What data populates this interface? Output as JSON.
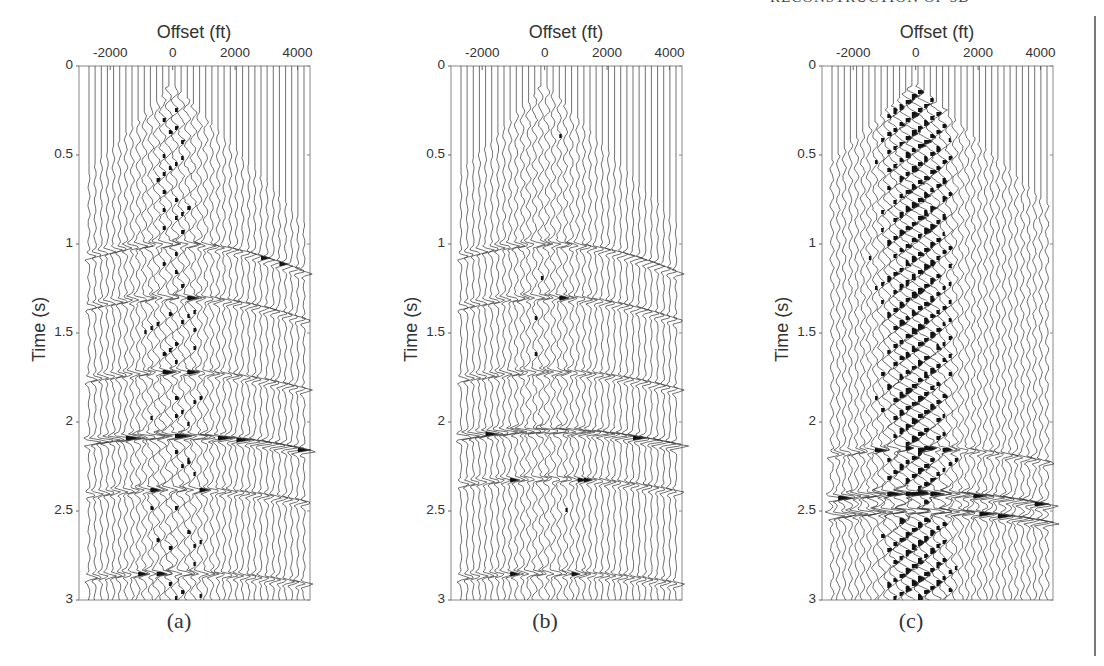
{
  "page": {
    "header_fragment": "RECONSTRUCTION OF 3D",
    "figure_panels": [
      {
        "id": "a",
        "caption": "(a)",
        "x_title": "Offset (ft)",
        "y_title": "Time (s)"
      },
      {
        "id": "b",
        "caption": "(b)",
        "x_title": "Offset (ft)",
        "y_title": "Time (s)"
      },
      {
        "id": "c",
        "caption": "(c)",
        "x_title": "Offset (ft)",
        "y_title": "Time (s)"
      }
    ]
  },
  "chart_data": [
    {
      "type": "seismic-wiggle",
      "title": "(a)",
      "xlabel": "Offset (ft)",
      "ylabel": "Time (s)",
      "xticks": [
        -2000,
        0,
        2000,
        4000
      ],
      "yticks": [
        0,
        0.5,
        1,
        1.5,
        2,
        2.5,
        3
      ],
      "xlim": [
        -3000,
        4400
      ],
      "ylim": [
        0,
        3
      ],
      "y_reversed": true,
      "trace_count": 36,
      "events": [
        {
          "t0": 1.0,
          "type": "hyperbolic reflection"
        },
        {
          "t0": 1.3,
          "type": "hyperbolic reflection"
        },
        {
          "t0": 1.72,
          "type": "reflection"
        },
        {
          "t0": 2.08,
          "type": "strong reflection"
        },
        {
          "t0": 2.38,
          "type": "reflection"
        },
        {
          "t0": 2.85,
          "type": "reflection"
        }
      ],
      "first_break_apex_s": 0.1,
      "noise": "moderate"
    },
    {
      "type": "seismic-wiggle",
      "title": "(b)",
      "xlabel": "Offset (ft)",
      "ylabel": "Time (s)",
      "xticks": [
        -2000,
        0,
        2000,
        4000
      ],
      "yticks": [
        0,
        0.5,
        1,
        1.5,
        2,
        2.5,
        3
      ],
      "xlim": [
        -3000,
        4400
      ],
      "ylim": [
        0,
        3
      ],
      "y_reversed": true,
      "trace_count": 36,
      "events": [
        {
          "t0": 1.0,
          "type": "hyperbolic reflection"
        },
        {
          "t0": 1.3,
          "type": "hyperbolic reflection"
        },
        {
          "t0": 1.72,
          "type": "reflection"
        },
        {
          "t0": 2.05,
          "type": "strong reflection"
        },
        {
          "t0": 2.32,
          "type": "reflection"
        },
        {
          "t0": 2.85,
          "type": "reflection"
        }
      ],
      "first_break_apex_s": 0.1,
      "noise": "low"
    },
    {
      "type": "seismic-wiggle",
      "title": "(c)",
      "xlabel": "Offset (ft)",
      "ylabel": "Time (s)",
      "xticks": [
        -2000,
        0,
        2000,
        4000
      ],
      "yticks": [
        0,
        0.5,
        1,
        1.5,
        2,
        2.5,
        3
      ],
      "xlim": [
        -3000,
        4400
      ],
      "ylim": [
        0,
        3
      ],
      "y_reversed": true,
      "trace_count": 36,
      "events": [
        {
          "t0": 2.15,
          "type": "reflection"
        },
        {
          "t0": 2.4,
          "type": "strong reflection"
        },
        {
          "t0": 2.5,
          "type": "strong reflection"
        }
      ],
      "first_break_apex_s": 0.1,
      "noise": "high (difference / removed noise)"
    }
  ]
}
